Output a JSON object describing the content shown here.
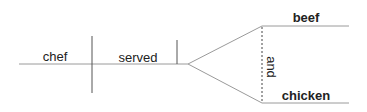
{
  "diagram": {
    "type": "sentence-diagram",
    "subject": "chef",
    "verb": "served",
    "compound_object": {
      "conjunction": "and",
      "items": [
        "beef",
        "chicken"
      ]
    }
  },
  "colors": {
    "baseline": "#9a9a9a",
    "divider": "#555555",
    "text": "#222222"
  }
}
